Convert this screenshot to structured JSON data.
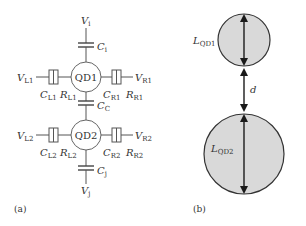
{
  "panel_a": {
    "label": "(a)",
    "dot1": "QD1",
    "dot2": "QD2",
    "top": {
      "V": "V",
      "V_sub": "i",
      "C": "C",
      "C_sub": "i"
    },
    "coupling": {
      "C": "C",
      "C_sub": "C"
    },
    "bottom": {
      "V": "V",
      "V_sub": "j",
      "C": "C",
      "C_sub": "j"
    },
    "qd1_left": {
      "V": "V",
      "V_sub": "L1",
      "C": "C",
      "C_sub": "L1",
      "R": "R",
      "R_sub": "L1"
    },
    "qd1_right": {
      "V": "V",
      "V_sub": "R1",
      "C": "C",
      "C_sub": "R1",
      "R": "R",
      "R_sub": "R1"
    },
    "qd2_left": {
      "V": "V",
      "V_sub": "L2",
      "C": "C",
      "C_sub": "L2",
      "R": "R",
      "R_sub": "L2"
    },
    "qd2_right": {
      "V": "V",
      "V_sub": "R2",
      "C": "C",
      "C_sub": "R2",
      "R": "R",
      "R_sub": "R2"
    }
  },
  "panel_b": {
    "label": "(b)",
    "size1": {
      "L": "L",
      "L_sub": "QD1"
    },
    "size2": {
      "L": "L",
      "L_sub": "QD2"
    },
    "distance": "d"
  }
}
